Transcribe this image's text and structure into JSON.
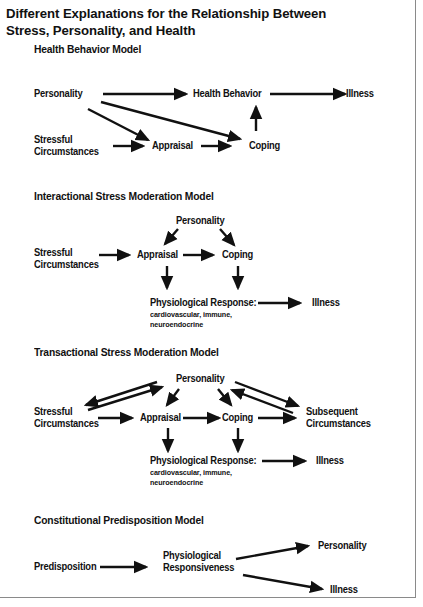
{
  "title": {
    "line1": "Different Explanations for the Relationship Between",
    "line2": "Stress, Personality, and Health"
  },
  "models": [
    {
      "name": "Health Behavior Model",
      "nodes": {
        "personality": "Personality",
        "health_behavior": "Health Behavior",
        "illness": "Illness",
        "stressful_1": "Stressful",
        "stressful_2": "Circumstances",
        "appraisal": "Appraisal",
        "coping": "Coping"
      },
      "edges": [
        [
          "Personality",
          "Health Behavior"
        ],
        [
          "Health Behavior",
          "Illness"
        ],
        [
          "Personality",
          "Appraisal"
        ],
        [
          "Personality",
          "Coping"
        ],
        [
          "Stressful Circumstances",
          "Appraisal"
        ],
        [
          "Appraisal",
          "Coping"
        ],
        [
          "Coping",
          "Health Behavior"
        ]
      ]
    },
    {
      "name": "Interactional Stress Moderation Model",
      "nodes": {
        "personality": "Personality",
        "stressful_1": "Stressful",
        "stressful_2": "Circumstances",
        "appraisal": "Appraisal",
        "coping": "Coping",
        "physio": "Physiological Response:",
        "physio_sub1": "cardiovascular, immune,",
        "physio_sub2": "neuroendocrine",
        "illness": "Illness"
      },
      "edges": [
        [
          "Personality",
          "Appraisal"
        ],
        [
          "Personality",
          "Coping"
        ],
        [
          "Stressful Circumstances",
          "Appraisal"
        ],
        [
          "Appraisal",
          "Coping"
        ],
        [
          "Appraisal",
          "Physiological Response"
        ],
        [
          "Coping",
          "Physiological Response"
        ],
        [
          "Physiological Response",
          "Illness"
        ]
      ]
    },
    {
      "name": "Transactional Stress Moderation Model",
      "nodes": {
        "personality": "Personality",
        "stressful_1": "Stressful",
        "stressful_2": "Circumstances",
        "appraisal": "Appraisal",
        "coping": "Coping",
        "subsequent_1": "Subsequent",
        "subsequent_2": "Circumstances",
        "physio": "Physiological Response:",
        "physio_sub1": "cardiovascular, immune,",
        "physio_sub2": "neuroendocrine",
        "illness": "Illness"
      },
      "edges": [
        [
          "Personality",
          "Stressful Circumstances"
        ],
        [
          "Stressful Circumstances",
          "Personality"
        ],
        [
          "Personality",
          "Appraisal"
        ],
        [
          "Personality",
          "Coping"
        ],
        [
          "Personality",
          "Subsequent Circumstances"
        ],
        [
          "Subsequent Circumstances",
          "Personality"
        ],
        [
          "Stressful Circumstances",
          "Appraisal"
        ],
        [
          "Appraisal",
          "Coping"
        ],
        [
          "Coping",
          "Subsequent Circumstances"
        ],
        [
          "Appraisal",
          "Physiological Response"
        ],
        [
          "Coping",
          "Physiological Response"
        ],
        [
          "Physiological Response",
          "Illness"
        ]
      ]
    },
    {
      "name": "Constitutional Predisposition Model",
      "nodes": {
        "predisposition": "Predisposition",
        "physio_1": "Physiological",
        "physio_2": "Responsiveness",
        "personality": "Personality",
        "illness": "Illness"
      },
      "edges": [
        [
          "Predisposition",
          "Physiological Responsiveness"
        ],
        [
          "Physiological Responsiveness",
          "Personality"
        ],
        [
          "Physiological Responsiveness",
          "Illness"
        ]
      ]
    }
  ]
}
